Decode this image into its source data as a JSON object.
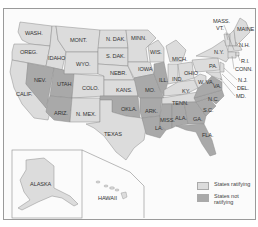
{
  "map": {
    "colors": {
      "ratifying": "#dcdcdc",
      "not_ratifying": "#a9a9a9",
      "border": "#8c8c8c",
      "background": "#fbfbfb"
    },
    "labels": {
      "wash": "WASH.",
      "oreg": "OREG.",
      "calif": "CALIF.",
      "idaho": "IDAHO",
      "nev": "NEV.",
      "mont": "MONT.",
      "wyo": "WYO.",
      "utah": "UTAH",
      "ariz": "ARIZ.",
      "colo": "COLO.",
      "nmex": "N. MEX.",
      "ndak": "N. DAK.",
      "sdak": "S. DAK.",
      "nebr": "NEBR.",
      "kans": "KANS.",
      "okla": "OKLA.",
      "texas": "TEXAS",
      "minn": "MINN.",
      "iowa": "IOWA",
      "mo": "MO.",
      "ark": "ARK.",
      "la": "LA.",
      "wis": "WIS.",
      "ill": "ILL.",
      "mich": "MICH.",
      "ind": "IND.",
      "ohio": "OHIO",
      "ky": "KY.",
      "tenn": "TENN.",
      "miss": "MISS.",
      "ala": "ALA.",
      "ga": "GA.",
      "fla": "FLA.",
      "sc": "S.C.",
      "nc": "N.C.",
      "va": "VA.",
      "wva": "W. VA.",
      "pa": "PA.",
      "ny": "N.Y.",
      "vt": "VT.",
      "mass": "MASS.",
      "maine": "MAINE",
      "nh": "N.H.",
      "ri": "R.I.",
      "conn": "CONN.",
      "nj": "N.J.",
      "del": "DEL.",
      "md": "MD.",
      "alaska": "ALASKA",
      "hawaii": "HAWAII"
    }
  },
  "legend": {
    "items": [
      {
        "label": "States ratifying",
        "color": "#dcdcdc"
      },
      {
        "label": "States not ratifying",
        "color": "#a9a9a9"
      }
    ]
  }
}
